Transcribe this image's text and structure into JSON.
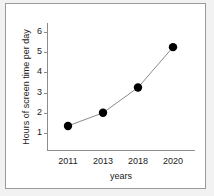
{
  "chart_data": {
    "type": "line",
    "title": "",
    "xlabel": "years",
    "ylabel": "Hours of screen time per day",
    "categories": [
      "2011",
      "2013",
      "2018",
      "2020"
    ],
    "values": [
      1.35,
      2.0,
      3.25,
      5.25
    ],
    "series": [
      {
        "name": "Hours of screen time per day",
        "values": [
          1.35,
          2.0,
          3.25,
          5.25
        ]
      }
    ],
    "yticks": [
      1,
      2,
      3,
      4,
      5,
      6
    ],
    "ytick_labels": [
      "1",
      "2",
      "3",
      "4",
      "5",
      "6"
    ],
    "ylim": [
      0,
      6.6
    ],
    "grid": false,
    "legend": false,
    "marker": "filled-circle",
    "marker_color": "#000000",
    "line_color": "#8a8a8a",
    "axis_color": "#8c8c8c",
    "plot_background": "#ffffff",
    "page_background": "#f2f2f2",
    "border_color": "#9a9a9a"
  }
}
